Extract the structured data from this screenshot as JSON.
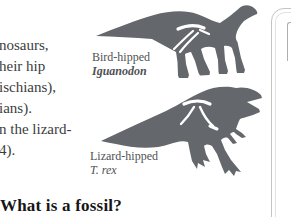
{
  "article": {
    "lines": [
      "nosaurs,",
      "heir hip",
      "ischians),",
      "ians).",
      "n the lizard-",
      "4)."
    ],
    "heading": "What is a fossil?"
  },
  "figure": {
    "bird": {
      "type_label": "Bird-hipped",
      "species_label": "Iguanodon"
    },
    "lizard": {
      "type_label": "Lizard-hipped",
      "species_label": "T. rex"
    }
  },
  "colors": {
    "silhouette": "#64676b",
    "bone": "#ffffff",
    "label_text": "#4f5155",
    "body_text": "#3b3d40",
    "heading_text": "#161616",
    "card_border": "#c4c4c1"
  }
}
